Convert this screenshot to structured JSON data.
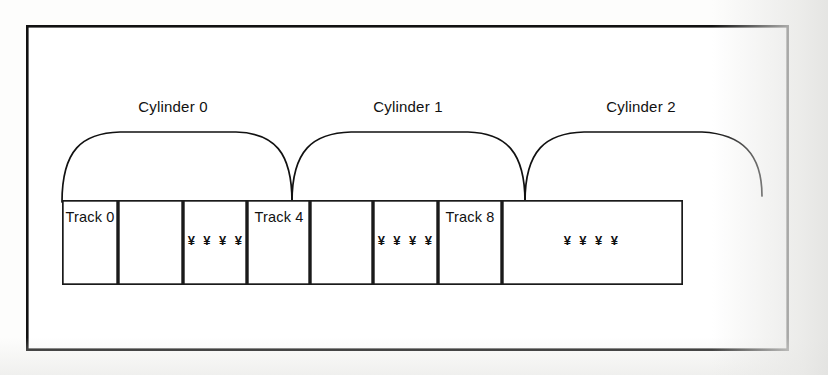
{
  "figure": {
    "name": "disk-cylinder-track-diagram",
    "background_color": "#fdfdfc",
    "line_color": "#111111",
    "frame": {
      "x": 26,
      "y": 25,
      "width": 763,
      "height": 326
    },
    "cylinders": [
      {
        "label": "Cylinder 0",
        "label_x": 173,
        "label_y": 112,
        "arc_start_x": 62,
        "arc_end_x": 292,
        "arc_top_y": 133
      },
      {
        "label": "Cylinder 1",
        "label_x": 408,
        "label_y": 112,
        "arc_start_x": 292,
        "arc_end_x": 525,
        "arc_top_y": 133
      },
      {
        "label": "Cylinder 2",
        "label_x": 641,
        "label_y": 112,
        "arc_start_x": 525,
        "arc_end_x": 762,
        "arc_top_y": 133
      }
    ],
    "track_row": {
      "x": 62,
      "y": 200,
      "width": 621,
      "height": 85,
      "cell_edges": [
        62,
        118,
        183,
        247,
        310,
        373,
        438,
        502,
        565,
        683
      ]
    },
    "cells": [
      {
        "label": "Track 0",
        "kind": "track",
        "x": 62,
        "width": 56
      },
      {
        "label": "",
        "kind": "blank",
        "x": 118,
        "width": 65
      },
      {
        "label": "¥ ¥ ¥ ¥",
        "kind": "ellipsis",
        "x": 183,
        "width": 64
      },
      {
        "label": "Track 4",
        "kind": "track",
        "x": 247,
        "width": 63
      },
      {
        "label": "",
        "kind": "blank",
        "x": 310,
        "width": 63
      },
      {
        "label": "¥ ¥ ¥ ¥",
        "kind": "ellipsis",
        "x": 373,
        "width": 65
      },
      {
        "label": "Track 8",
        "kind": "track",
        "x": 438,
        "width": 64
      },
      {
        "label": "¥ ¥ ¥ ¥",
        "kind": "ellipsis",
        "x": 502,
        "width": 181
      }
    ]
  }
}
